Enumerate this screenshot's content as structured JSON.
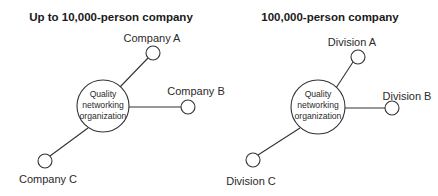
{
  "diagrams": [
    {
      "title": "Up to 10,000-person company",
      "hub": {
        "lines": [
          "Quality",
          "networking",
          "organization"
        ]
      },
      "nodes": [
        {
          "id": "a",
          "label": "Company A"
        },
        {
          "id": "b",
          "label": "Company B"
        },
        {
          "id": "c",
          "label": "Company C"
        }
      ]
    },
    {
      "title": "100,000-person company",
      "hub": {
        "lines": [
          "Quality",
          "networking",
          "organization"
        ]
      },
      "nodes": [
        {
          "id": "a",
          "label": "Division A"
        },
        {
          "id": "b",
          "label": "Division B"
        },
        {
          "id": "c",
          "label": "Division C"
        }
      ]
    }
  ],
  "colors": {
    "stroke": "#333333",
    "text": "#2a2a2a",
    "background": "#ffffff"
  }
}
